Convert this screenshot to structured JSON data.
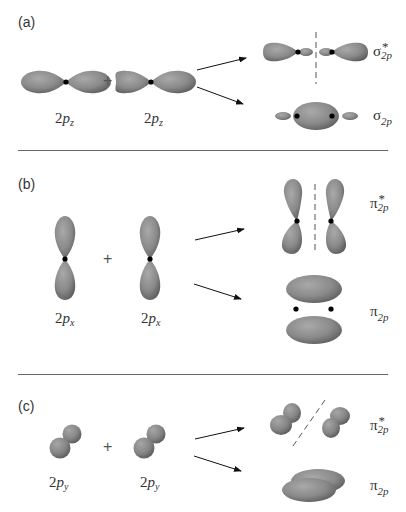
{
  "figure": {
    "orbital_color": "#8a8a8a",
    "nucleus_color": "#000000",
    "panels": [
      {
        "label": "(a)",
        "atomic_orbitals": [
          {
            "label_prefix": "2",
            "label_p": "p",
            "label_sub": "z"
          },
          {
            "label_prefix": "2",
            "label_p": "p",
            "label_sub": "z"
          }
        ],
        "operator": "+",
        "molecular_orbitals": [
          {
            "symbol": "σ",
            "superscript": "*",
            "subscript": "2p",
            "type": "antibonding"
          },
          {
            "symbol": "σ",
            "superscript": "",
            "subscript": "2p",
            "type": "bonding"
          }
        ]
      },
      {
        "label": "(b)",
        "atomic_orbitals": [
          {
            "label_prefix": "2",
            "label_p": "p",
            "label_sub": "x"
          },
          {
            "label_prefix": "2",
            "label_p": "p",
            "label_sub": "x"
          }
        ],
        "operator": "+",
        "molecular_orbitals": [
          {
            "symbol": "π",
            "superscript": "*",
            "subscript": "2p",
            "type": "antibonding"
          },
          {
            "symbol": "π",
            "superscript": "",
            "subscript": "2p",
            "type": "bonding"
          }
        ]
      },
      {
        "label": "(c)",
        "atomic_orbitals": [
          {
            "label_prefix": "2",
            "label_p": "p",
            "label_sub": "y"
          },
          {
            "label_prefix": "2",
            "label_p": "p",
            "label_sub": "y"
          }
        ],
        "operator": "+",
        "molecular_orbitals": [
          {
            "symbol": "π",
            "superscript": "*",
            "subscript": "2p",
            "type": "antibonding"
          },
          {
            "symbol": "π",
            "superscript": "",
            "subscript": "2p",
            "type": "bonding"
          }
        ]
      }
    ]
  }
}
